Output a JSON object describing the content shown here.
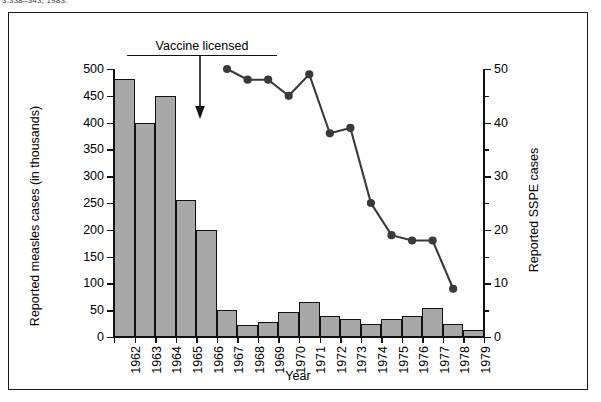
{
  "citation": "3:338–343, 1983.",
  "annotation": {
    "text": "Vaccine licensed",
    "points_to_year": "1963"
  },
  "chart_data": {
    "type": "bar",
    "title": "",
    "xlabel": "Year",
    "ylabel": "Reported measles cases (in thousands)",
    "y2label": "Reported SSPE cases",
    "grid": false,
    "legend": "none",
    "categories": [
      "1962",
      "1963",
      "1964",
      "1965",
      "1966",
      "1967",
      "1968",
      "1969",
      "1970",
      "1971",
      "1972",
      "1973",
      "1974",
      "1975",
      "1976",
      "1977",
      "1978",
      "1979"
    ],
    "ylim": [
      0,
      500
    ],
    "yticks": [
      0,
      50,
      100,
      150,
      200,
      250,
      300,
      350,
      400,
      450,
      500
    ],
    "y2lim": [
      0,
      50
    ],
    "y2ticks": [
      0,
      10,
      20,
      30,
      40,
      50
    ],
    "y2minorticks": [
      5,
      15,
      25,
      35,
      45
    ],
    "series": [
      {
        "name": "Reported measles cases (in thousands)",
        "type": "bar",
        "axis": "left",
        "values": [
          482,
          400,
          450,
          255,
          200,
          50,
          22,
          28,
          47,
          65,
          39,
          33,
          25,
          33,
          40,
          55,
          25,
          14
        ]
      },
      {
        "name": "Reported SSPE cases",
        "type": "line",
        "axis": "right",
        "x": [
          "1967",
          "1968",
          "1969",
          "1970",
          "1971",
          "1972",
          "1973",
          "1974",
          "1975",
          "1976",
          "1977",
          "1978"
        ],
        "values": [
          50,
          48,
          48,
          45,
          49,
          38,
          39,
          25,
          19,
          18,
          18,
          9
        ]
      }
    ]
  }
}
